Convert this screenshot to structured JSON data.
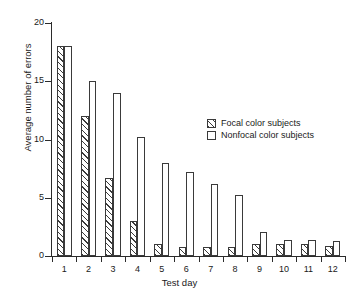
{
  "chart_data": {
    "type": "bar",
    "title": "",
    "xlabel": "Test day",
    "ylabel": "Average number of errors",
    "categories": [
      "1",
      "2",
      "3",
      "4",
      "5",
      "6",
      "7",
      "8",
      "9",
      "10",
      "11",
      "12"
    ],
    "series": [
      {
        "name": "Focal color subjects",
        "pattern": "diagonal-hatch",
        "values": [
          18,
          12,
          6.7,
          3,
          1,
          0.8,
          0.8,
          0.8,
          1,
          1,
          1,
          0.9
        ]
      },
      {
        "name": "Nonfocal color subjects",
        "pattern": "solid-white",
        "values": [
          18,
          15,
          14,
          10.2,
          8,
          7.2,
          6.2,
          5.2,
          2.1,
          1.4,
          1.4,
          1.3
        ]
      }
    ],
    "ylim": [
      0,
      20
    ],
    "yticks": [
      "0",
      "5",
      "10",
      "15",
      "20"
    ],
    "ytick_values": [
      0,
      5,
      10,
      15,
      20
    ],
    "xlim": [
      0.4,
      12.6
    ],
    "grid": false,
    "legend_position": "upper right inside"
  },
  "legend": {
    "entries": [
      {
        "label": "Focal color subjects"
      },
      {
        "label": "Nonfocal color subjects"
      }
    ]
  },
  "colors": {
    "axis": "#2b2b2b",
    "bar_outline": "#3a3a3a",
    "bar_fill": "#ffffff",
    "background": "#ffffff"
  }
}
